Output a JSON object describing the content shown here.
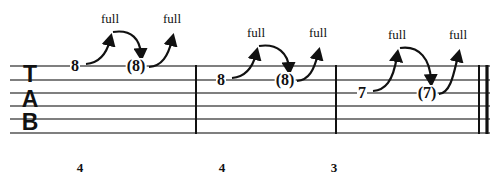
{
  "document": {
    "kind": "guitar-tablature",
    "notation_system": "TAB",
    "background_color": "#ffffff",
    "ink_color": "#111111",
    "staff_line_color": "#555555"
  },
  "clef": {
    "letters": [
      "T",
      "A",
      "B"
    ],
    "label": "TAB"
  },
  "staff": {
    "string_count": 6,
    "left": 10,
    "right": 490,
    "line_y": [
      66,
      80,
      93,
      106,
      119,
      133
    ],
    "line_color": "#555555",
    "line_width": 1.6
  },
  "barlines": [
    {
      "name": "barline-1",
      "x": 196,
      "style": "single"
    },
    {
      "name": "barline-2",
      "x": 336,
      "style": "single"
    },
    {
      "name": "barline-end",
      "x": 478,
      "style": "double-thin-thick"
    }
  ],
  "measures": [
    {
      "index": 1,
      "beat_label": "4",
      "beat_label_x": 80,
      "string_index": 0,
      "notes": [
        {
          "fret": "8",
          "x": 75,
          "y": 66,
          "ghost": false
        },
        {
          "fret": "(8)",
          "x": 136,
          "y": 66,
          "ghost": true
        }
      ],
      "bends": [
        {
          "text": "full",
          "text_x": 110,
          "text_y": 18,
          "type": "bend-up"
        },
        {
          "text": "full",
          "text_x": 172,
          "text_y": 18,
          "type": "bend-up"
        }
      ]
    },
    {
      "index": 2,
      "beat_label": "4",
      "beat_label_x": 222,
      "string_index": 1,
      "notes": [
        {
          "fret": "8",
          "x": 221,
          "y": 80,
          "ghost": false
        },
        {
          "fret": "(8)",
          "x": 285,
          "y": 80,
          "ghost": true
        }
      ],
      "bends": [
        {
          "text": "full",
          "text_x": 256,
          "text_y": 32,
          "type": "bend-up"
        },
        {
          "text": "full",
          "text_x": 318,
          "text_y": 32,
          "type": "bend-up"
        }
      ]
    },
    {
      "index": 3,
      "beat_label": "3",
      "beat_label_x": 334,
      "string_index": 2,
      "notes": [
        {
          "fret": "7",
          "x": 362,
          "y": 93,
          "ghost": false
        },
        {
          "fret": "(7)",
          "x": 427,
          "y": 93,
          "ghost": true
        }
      ],
      "bends": [
        {
          "text": "full",
          "text_x": 397,
          "text_y": 34,
          "type": "bend-up"
        },
        {
          "text": "full",
          "text_x": 458,
          "text_y": 34,
          "type": "bend-up"
        }
      ]
    }
  ],
  "clef_letters_layout": [
    {
      "char": "T",
      "x": 30,
      "y": 74
    },
    {
      "char": "A",
      "x": 30,
      "y": 99
    },
    {
      "char": "B",
      "x": 30,
      "y": 122
    }
  ],
  "beat_numbers": [
    {
      "value": "4",
      "x": 80,
      "y": 167
    },
    {
      "value": "4",
      "x": 222,
      "y": 167
    },
    {
      "value": "3",
      "x": 334,
      "y": 167
    }
  ],
  "bend_labels": [
    {
      "value": "full",
      "x": 110,
      "y": 18
    },
    {
      "value": "full",
      "x": 172,
      "y": 18
    },
    {
      "value": "full",
      "x": 256,
      "y": 32
    },
    {
      "value": "full",
      "x": 318,
      "y": 32
    },
    {
      "value": "full",
      "x": 397,
      "y": 34
    },
    {
      "value": "full",
      "x": 458,
      "y": 34
    }
  ],
  "fret_numbers": [
    {
      "value": "8",
      "x": 75,
      "y": 66
    },
    {
      "value": "(8)",
      "x": 136,
      "y": 66
    },
    {
      "value": "8",
      "x": 221,
      "y": 80
    },
    {
      "value": "(8)",
      "x": 285,
      "y": 80
    },
    {
      "value": "7",
      "x": 362,
      "y": 93
    },
    {
      "value": "(7)",
      "x": 427,
      "y": 93
    }
  ]
}
